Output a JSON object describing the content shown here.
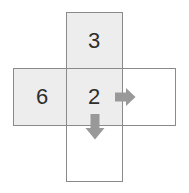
{
  "diagram": {
    "colors": {
      "shaded_fill": "#ededed",
      "unshaded_fill": "#ffffff",
      "border": "#8a8a8a",
      "text": "#2e2e2e",
      "arrow": "#999999",
      "background": "#ffffff"
    },
    "shapes": [
      {
        "name": "vertical-rect",
        "orientation": "vertical",
        "x": 66,
        "y": 12,
        "width": 57,
        "height": 170,
        "shaded": "top-arm-only"
      },
      {
        "name": "horizontal-rect",
        "orientation": "horizontal",
        "x": 13,
        "y": 68,
        "width": 163,
        "height": 58,
        "shaded": "left-arm-and-centre"
      }
    ],
    "cells": [
      {
        "name": "top",
        "value": "3",
        "shaded": true,
        "x": 94,
        "y": 40
      },
      {
        "name": "left",
        "value": "6",
        "shaded": true,
        "x": 42,
        "y": 97
      },
      {
        "name": "centre",
        "value": "2",
        "shaded": true,
        "x": 94,
        "y": 97
      },
      {
        "name": "right",
        "value": "",
        "shaded": false,
        "x": 149,
        "y": 97
      },
      {
        "name": "bottom",
        "value": "",
        "shaded": false,
        "x": 94,
        "y": 153
      }
    ],
    "arrows": [
      {
        "name": "arrow-right",
        "direction": "right",
        "icon": "arrow-right-icon",
        "color": "#999999",
        "x": 113,
        "y": 85
      },
      {
        "name": "arrow-down",
        "direction": "down",
        "icon": "arrow-down-icon",
        "color": "#999999",
        "x": 83,
        "y": 112
      }
    ]
  }
}
